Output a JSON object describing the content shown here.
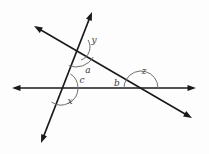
{
  "figure": {
    "type": "geometry-diagram",
    "background_color": "#fdfdfd",
    "line_color": "#1a1a1a",
    "arc_color": "#6e6e6e",
    "label_color": "#3a3a3a"
  },
  "lines": [
    {
      "name": "horizontal-line",
      "x1": 12,
      "y1": 88,
      "x2": 196,
      "y2": 88,
      "arrow_start": true,
      "arrow_end": true
    },
    {
      "name": "steep-line",
      "x1": 92,
      "y1": 12,
      "x2": 41,
      "y2": 143,
      "arrow_start": true,
      "arrow_end": true
    },
    {
      "name": "diagonal-line",
      "x1": 34,
      "y1": 26,
      "x2": 192,
      "y2": 118,
      "arrow_start": true,
      "arrow_end": true
    }
  ],
  "intersections": [
    {
      "name": "top-intersection",
      "x": 76,
      "y": 47
    },
    {
      "name": "left-intersection",
      "x": 61,
      "y": 88
    },
    {
      "name": "right-intersection",
      "x": 141,
      "y": 88
    }
  ],
  "angles": [
    {
      "name": "angle-y",
      "label": "y",
      "label_x": 94,
      "label_y": 40,
      "vertex_x": 76,
      "vertex_y": 47,
      "radius": 14,
      "start_deg": -30,
      "end_deg": 69
    },
    {
      "name": "angle-a",
      "label": "a",
      "label_x": 88,
      "label_y": 70,
      "vertex_x": 76,
      "vertex_y": 47,
      "radius": 20,
      "start_deg": 30,
      "end_deg": 111
    },
    {
      "name": "angle-c",
      "label": "c",
      "label_x": 82,
      "label_y": 80,
      "vertex_x": 61,
      "vertex_y": 88,
      "radius": 17,
      "start_deg": -56,
      "end_deg": 0
    },
    {
      "name": "angle-x",
      "label": "x",
      "label_x": 70,
      "label_y": 101,
      "vertex_x": 61,
      "vertex_y": 88,
      "radius": 17,
      "start_deg": 0,
      "end_deg": 124
    },
    {
      "name": "angle-b",
      "label": "b",
      "label_x": 117,
      "label_y": 83,
      "vertex_x": 141,
      "vertex_y": 88,
      "radius": 17,
      "start_deg": 180,
      "end_deg": 210
    },
    {
      "name": "angle-z",
      "label": "z",
      "label_x": 144,
      "label_y": 71,
      "vertex_x": 141,
      "vertex_y": 88,
      "radius": 17,
      "start_deg": -150,
      "end_deg": 0
    }
  ]
}
